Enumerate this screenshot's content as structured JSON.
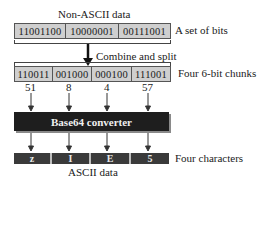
{
  "top": {
    "title": "Non-ASCII data",
    "bytes": [
      "11001100",
      "10000001",
      "00111001"
    ],
    "side_label": "A set of bits"
  },
  "step": {
    "label": "Combine and split"
  },
  "chunks": {
    "values": [
      "110011",
      "001000",
      "000100",
      "111001"
    ],
    "side_label": "Four 6-bit chunks",
    "decimals": [
      "51",
      "8",
      "4",
      "57"
    ]
  },
  "converter": {
    "label": "Base64 converter"
  },
  "output": {
    "chars": [
      "z",
      "I",
      "E",
      "5"
    ],
    "side_label": "Four characters",
    "caption": "ASCII data"
  },
  "colors": {
    "cell_fill": "#cfcfcf",
    "converter_fill": "#1e1e1e",
    "char_fill": "#3a3a3a"
  }
}
